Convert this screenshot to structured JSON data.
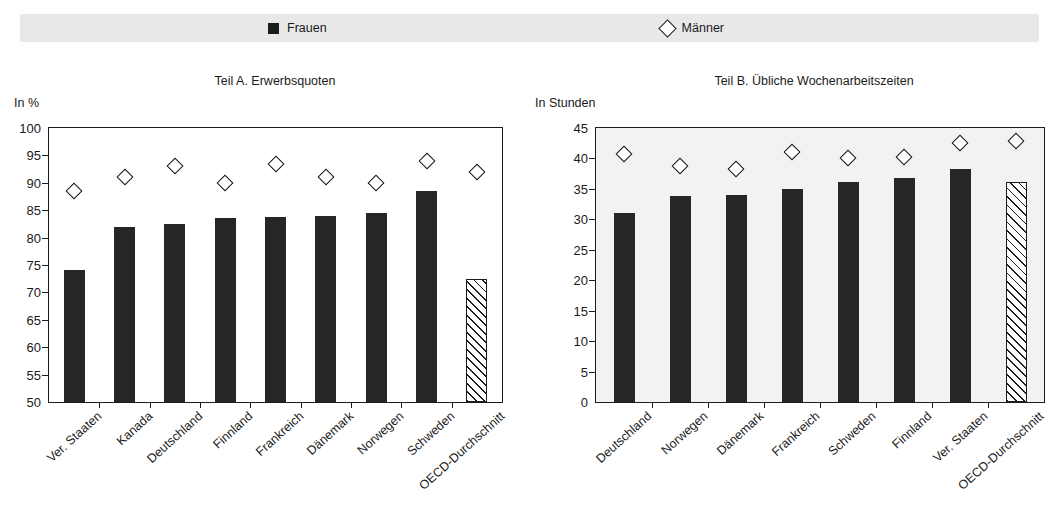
{
  "page": {
    "cropped_text_fragment": "",
    "background": "#ffffff"
  },
  "legend": {
    "items": [
      {
        "label": "Frauen",
        "marker": "filled-square",
        "color": "#1c1c1c"
      },
      {
        "label": "Männer",
        "marker": "open-diamond",
        "color": "#1c1c1c"
      }
    ],
    "background": "#e8e8e8"
  },
  "chart_data": [
    {
      "type": "bar",
      "panel": "A",
      "title": "Teil A. Erwerbsquoten",
      "ylabel": "In %",
      "xlabel": "",
      "ylim": [
        50,
        100
      ],
      "yticks": [
        50,
        55,
        60,
        65,
        70,
        75,
        80,
        85,
        90,
        95,
        100
      ],
      "grid": false,
      "legend_position": "top",
      "categories": [
        "Ver. Staaten",
        "Kanada",
        "Deutschland",
        "Finnland",
        "Frankreich",
        "Dänemark",
        "Norwegen",
        "Schweden",
        "OECD-Durchschnitt"
      ],
      "series": [
        {
          "name": "Frauen",
          "marker": "bar",
          "values": [
            74.0,
            82.0,
            82.5,
            83.5,
            83.7,
            84.0,
            84.5,
            88.5,
            72.5
          ]
        },
        {
          "name": "Männer",
          "marker": "open-diamond",
          "values": [
            88.5,
            91.0,
            93.0,
            90.0,
            93.5,
            91.0,
            90.0,
            94.0,
            92.0
          ]
        }
      ],
      "hatched_category_index": 8
    },
    {
      "type": "bar",
      "panel": "B",
      "title": "Teil B. Übliche Wochenarbeitszeiten",
      "ylabel": "In Stunden",
      "xlabel": "",
      "ylim": [
        0,
        45
      ],
      "yticks": [
        0,
        5,
        10,
        15,
        20,
        25,
        30,
        35,
        40,
        45
      ],
      "grid": false,
      "legend_position": "top",
      "categories": [
        "Deutschland",
        "Norwegen",
        "Dänemark",
        "Frankreich",
        "Schweden",
        "Finnland",
        "Ver. Staaten",
        "OECD-Durchschnitt"
      ],
      "series": [
        {
          "name": "Frauen",
          "marker": "bar",
          "values": [
            31.0,
            33.8,
            34.0,
            35.0,
            36.2,
            36.8,
            38.2,
            36.2
          ]
        },
        {
          "name": "Männer",
          "marker": "open-diamond",
          "values": [
            40.8,
            38.8,
            38.2,
            41.0,
            40.0,
            40.3,
            42.5,
            42.8
          ]
        }
      ],
      "hatched_category_index": 7
    }
  ]
}
